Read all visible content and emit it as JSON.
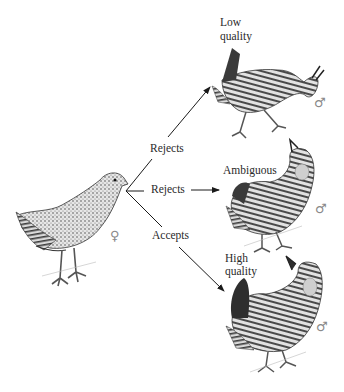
{
  "diagram": {
    "type": "mate-choice illustration",
    "female": {
      "label_symbol": "♀",
      "sex": "female"
    },
    "branches": [
      {
        "action": "Rejects",
        "target_quality": "Low quality",
        "target_sex_symbol": "♂"
      },
      {
        "action": "Rejects",
        "target_quality": "Ambiguous",
        "target_sex_symbol": "♂"
      },
      {
        "action": "Accepts",
        "target_quality": "High quality",
        "target_sex_symbol": "♂"
      }
    ],
    "labels": {
      "low_line1": "Low",
      "low_line2": "quality",
      "ambiguous": "Ambiguous",
      "high_line1": "High",
      "high_line2": "quality",
      "rejects_upper": "Rejects",
      "rejects_middle": "Rejects",
      "accepts": "Accepts",
      "female_symbol": "♀",
      "male_symbol_low": "♂",
      "male_symbol_ambiguous": "♂",
      "male_symbol_high": "♂"
    },
    "colors": {
      "line": "#1a1a1a",
      "symbol": "#8a8a8a",
      "bird_dark": "#3a3a3a",
      "bird_mid": "#9a9a9a",
      "bird_light": "#d8d8d8"
    }
  }
}
